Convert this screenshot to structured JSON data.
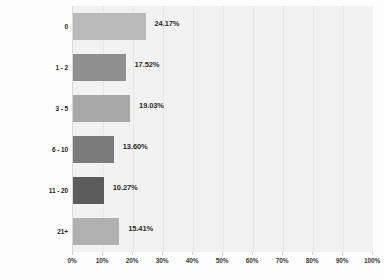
{
  "chart_data": {
    "type": "bar",
    "orientation": "horizontal",
    "title": "",
    "xlabel": "",
    "ylabel": "",
    "categories": [
      "0",
      "1 - 2",
      "3 - 5",
      "6 - 10",
      "11 - 20",
      "21+"
    ],
    "values": [
      24.17,
      17.52,
      19.03,
      13.6,
      10.27,
      15.41
    ],
    "value_labels": [
      "24.17%",
      "17.52%",
      "19.03%",
      "13.60%",
      "10.27%",
      "15.41%"
    ],
    "bar_colors": [
      "#b9b9b9",
      "#8f8f8f",
      "#a8a8a8",
      "#7b7b7b",
      "#5c5c5c",
      "#b0b0b0"
    ],
    "xlim": [
      0,
      100
    ],
    "xtick_labels": [
      "0%",
      "10%",
      "20%",
      "30%",
      "40%",
      "50%",
      "60%",
      "70%",
      "80%",
      "90%",
      "100%"
    ],
    "xtick_values": [
      0,
      10,
      20,
      30,
      40,
      50,
      60,
      70,
      80,
      90,
      100
    ],
    "grid": true,
    "legend": null,
    "plot_background": "#f2f2f2",
    "page_background": "#fdfdfd",
    "label_color": "#2a2a2a"
  }
}
